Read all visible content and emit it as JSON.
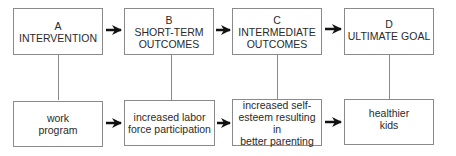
{
  "diagram": {
    "type": "logic-model-flow",
    "columns": [
      {
        "id": "A",
        "header_letter": "A",
        "header_lines": [
          "INTERVENTION"
        ],
        "detail_lines": [
          "work",
          "program"
        ]
      },
      {
        "id": "B",
        "header_letter": "B",
        "header_lines": [
          "SHORT-TERM",
          "OUTCOMES"
        ],
        "detail_lines": [
          "increased labor",
          "force participation"
        ]
      },
      {
        "id": "C",
        "header_letter": "C",
        "header_lines": [
          "INTERMEDIATE",
          "OUTCOMES"
        ],
        "detail_lines": [
          "increased self-",
          "esteem resulting in",
          "better parenting"
        ]
      },
      {
        "id": "D",
        "header_letter": "D",
        "header_lines": [
          "ULTIMATE GOAL"
        ],
        "detail_lines": [
          "healthier",
          "kids"
        ]
      }
    ],
    "edges": [
      {
        "from": "A",
        "to": "B",
        "row": "top"
      },
      {
        "from": "B",
        "to": "C",
        "row": "top"
      },
      {
        "from": "C",
        "to": "D",
        "row": "top"
      },
      {
        "from": "A",
        "to": "B",
        "row": "bottom"
      },
      {
        "from": "B",
        "to": "C",
        "row": "bottom"
      },
      {
        "from": "C",
        "to": "D",
        "row": "bottom"
      }
    ],
    "colors": {
      "border": "#8a8a8a",
      "arrow": "#111111",
      "text": "#2a2a2a",
      "background": "#ffffff"
    }
  }
}
